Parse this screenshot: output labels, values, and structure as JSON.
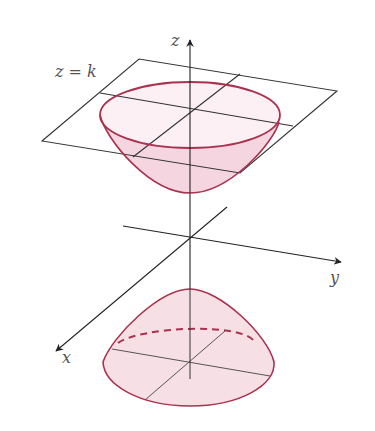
{
  "figure": {
    "colors": {
      "axis": "#222222",
      "plane": "#333333",
      "surface_stroke": "#a8324f",
      "surface_fill": "#f6dbe3",
      "surface_fill_light": "#fbeef2",
      "label": "#555555"
    }
  },
  "labels": {
    "z_axis": "z",
    "y_axis": "y",
    "x_axis": "x",
    "plane": "z = k"
  }
}
